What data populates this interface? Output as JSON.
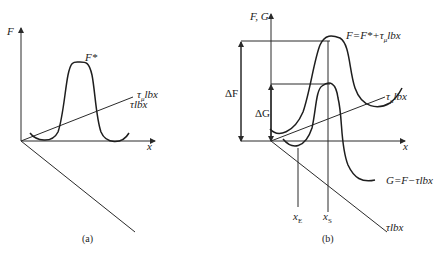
{
  "panels": [
    {
      "caption": "(a)",
      "axes": {
        "vertical": "F",
        "horizontal": "x",
        "oblique": "τlbx"
      },
      "curve_label": "F*",
      "line_label_main": "τ",
      "line_label_sub": "μ",
      "line_label_rest": "lbx"
    },
    {
      "caption": "(b)",
      "axes": {
        "vertical": "F, G",
        "horizontal": "x",
        "oblique": "τlbx"
      },
      "upper_curve_label": {
        "main": "F=F*+τ",
        "sub": "μ",
        "rest": "lbx"
      },
      "lower_curve_label": "G=F−τlbx",
      "line_label_main": "τ",
      "line_label_sub": "μ",
      "line_label_rest": "lbx",
      "delta_F": "ΔF",
      "delta_G": "ΔG",
      "markers": [
        {
          "main": "x",
          "sub": "E"
        },
        {
          "main": "x",
          "sub": "S"
        }
      ]
    }
  ],
  "colors": {
    "line": "#2a2a2a",
    "background": "#ffffff"
  }
}
